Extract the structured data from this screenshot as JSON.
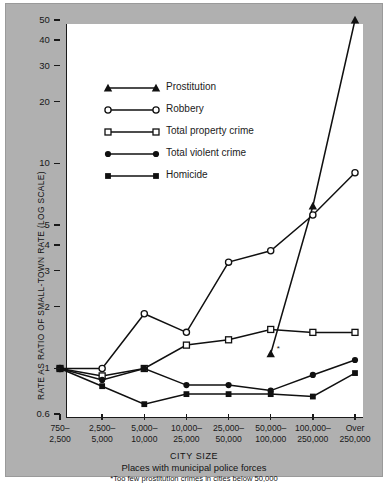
{
  "chart_data": {
    "type": "line",
    "title": "",
    "xlabel": "CITY SIZE",
    "xlabel_sub": "Places with municipal police forces",
    "footnote": "*Too few prostitution crimes in cities below 50,000",
    "ylabel": "RATE AS RATIO OF SMALL-TOWN RATE (LOG SCALE)",
    "yscale": "log",
    "ylim": [
      0.6,
      50
    ],
    "grid": false,
    "legend_position": "upper-left-inside",
    "yticks": [
      50,
      40,
      30,
      20,
      10,
      5,
      4,
      3,
      2,
      1,
      0.6
    ],
    "ytick_labels": [
      "50",
      "40",
      "30",
      "20",
      "10",
      "5",
      "4",
      "3",
      "2",
      "1",
      "0.6"
    ],
    "categories": [
      "750–\n2,500",
      "2,500–\n5,000",
      "5,000–\n10,000",
      "10,000–\n25,000",
      "25,000–\n50,000",
      "50,000–\n100,000",
      "100,000–\n250,000",
      "Over\n250,000"
    ],
    "category_lines": [
      [
        "750–",
        "2,500"
      ],
      [
        "2,500–",
        "5,000"
      ],
      [
        "5,000–",
        "10,000"
      ],
      [
        "10,000–",
        "25,000"
      ],
      [
        "25,000–",
        "50,000"
      ],
      [
        "50,000–",
        "100,000"
      ],
      [
        "100,000–",
        "250,000"
      ],
      [
        "Over",
        "250,000"
      ]
    ],
    "series": [
      {
        "name": "Prostitution",
        "marker": "triangle-filled",
        "values": [
          null,
          null,
          null,
          null,
          null,
          1.18,
          6.2,
          50.0
        ],
        "annotation": "*"
      },
      {
        "name": "Robbery",
        "marker": "circle-open",
        "values": [
          1.0,
          1.0,
          1.85,
          1.5,
          3.3,
          3.75,
          5.6,
          9.0
        ]
      },
      {
        "name": "Total property crime",
        "marker": "square-open",
        "values": [
          1.0,
          0.92,
          1.0,
          1.3,
          1.38,
          1.55,
          1.5,
          1.5
        ]
      },
      {
        "name": "Total violent crime",
        "marker": "circle-filled",
        "values": [
          1.0,
          0.88,
          1.0,
          0.83,
          0.83,
          0.78,
          0.93,
          1.1
        ]
      },
      {
        "name": "Homicide",
        "marker": "square-filled",
        "values": [
          1.0,
          0.82,
          0.67,
          0.75,
          0.75,
          0.75,
          0.73,
          0.95
        ]
      }
    ]
  },
  "legend": {
    "items": [
      {
        "label": "Prostitution",
        "marker": "triangle-filled"
      },
      {
        "label": "Robbery",
        "marker": "circle-open"
      },
      {
        "label": "Total property crime",
        "marker": "square-open"
      },
      {
        "label": "Total violent crime",
        "marker": "circle-filled"
      },
      {
        "label": "Homicide",
        "marker": "square-filled"
      }
    ]
  },
  "colors": {
    "ink": "#1a1a1a",
    "plate": "#b0b0b0",
    "plot_bg": "#ffffff"
  }
}
